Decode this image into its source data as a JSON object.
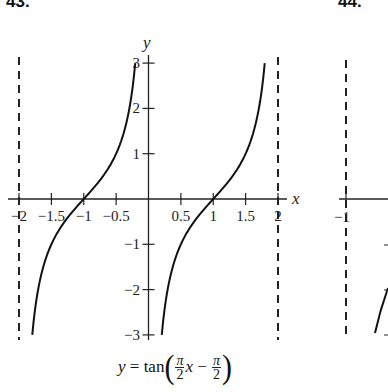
{
  "problems": [
    {
      "label": "43."
    },
    {
      "label": "44."
    }
  ],
  "chart_data": [
    {
      "type": "line",
      "title": "y = tan(π/2 x − π/2)",
      "xlabel": "x",
      "ylabel": "y",
      "xlim": [
        -2,
        2
      ],
      "ylim": [
        -3,
        3
      ],
      "grid": false,
      "x_ticks": [
        -2,
        -1.5,
        -1,
        -0.5,
        0.5,
        1,
        1.5,
        2
      ],
      "x_tick_labels": [
        "−2",
        "−1.5",
        "−1",
        "−0.5",
        "0.5",
        "1",
        "1.5",
        "2"
      ],
      "y_ticks": [
        3,
        2,
        1,
        -1,
        -2,
        -3
      ],
      "y_tick_labels": [
        "3",
        "2",
        "1",
        "−1",
        "−2",
        "−3"
      ],
      "asymptotes": [
        -2,
        0,
        2
      ],
      "asymptote_style": "dashed (x = −2 and x = 2 drawn; x = 0 coincides with y-axis)",
      "series": [
        {
          "name": "left branch",
          "x": [
            -1.795,
            -1.6,
            -1.4,
            -1.2,
            -1.0,
            -0.8,
            -0.6,
            -0.4,
            -0.205
          ],
          "y": [
            -3.0,
            -1.376,
            -0.727,
            -0.325,
            0.0,
            0.325,
            0.727,
            1.376,
            3.0
          ]
        },
        {
          "name": "right branch",
          "x": [
            0.205,
            0.4,
            0.6,
            0.8,
            1.0,
            1.2,
            1.4,
            1.6,
            1.795
          ],
          "y": [
            -3.0,
            -1.376,
            -0.727,
            -0.325,
            0.0,
            0.325,
            0.727,
            1.376,
            3.0
          ]
        }
      ],
      "annotations": [
        "y = tan(π/2 x − π/2)"
      ]
    },
    {
      "type": "line",
      "title": "(partially visible, cut off at right edge)",
      "x_tick_labels": [
        "−1"
      ],
      "asymptotes": [
        -1
      ],
      "series": []
    }
  ],
  "caption": {
    "lhs": "y",
    "eq": " = tan",
    "pi": "π",
    "two": "2",
    "x": "x",
    "minus": " − "
  }
}
